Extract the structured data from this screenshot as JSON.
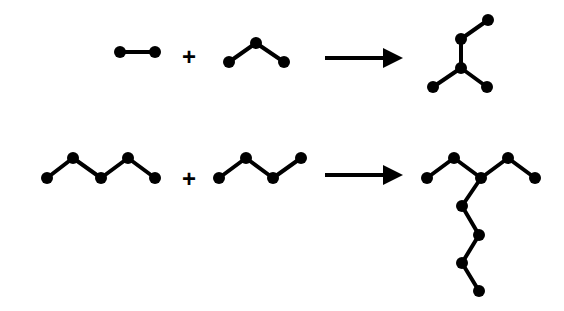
{
  "diagram": {
    "style": {
      "color": "#000000",
      "background": "#ffffff",
      "node_radius": 6,
      "bond_width": 4
    },
    "operators": {
      "plus": "+"
    },
    "reactions": [
      {
        "id": "reaction-1",
        "reactants": [
          {
            "name": "dimer",
            "nodes": [
              [
                120,
                52
              ],
              [
                155,
                52
              ]
            ],
            "bonds": [
              [
                0,
                1
              ]
            ]
          },
          {
            "name": "trimer",
            "nodes": [
              [
                229,
                62
              ],
              [
                256,
                43
              ],
              [
                284,
                62
              ]
            ],
            "bonds": [
              [
                0,
                1
              ],
              [
                1,
                2
              ]
            ]
          }
        ],
        "plus_position": [
          189,
          56
        ],
        "arrow": {
          "x1": 325,
          "x2": 395,
          "y": 58
        },
        "product": {
          "name": "branched-pentamer",
          "nodes": [
            [
              488,
              20
            ],
            [
              461,
              39
            ],
            [
              461,
              68
            ],
            [
              433,
              87
            ],
            [
              487,
              87
            ]
          ],
          "bonds": [
            [
              0,
              1
            ],
            [
              1,
              2
            ],
            [
              2,
              3
            ],
            [
              2,
              4
            ]
          ]
        }
      },
      {
        "id": "reaction-2",
        "reactants": [
          {
            "name": "pentamer",
            "nodes": [
              [
                47,
                178
              ],
              [
                73,
                158
              ],
              [
                101,
                178
              ],
              [
                128,
                158
              ],
              [
                155,
                178
              ]
            ],
            "bonds": [
              [
                0,
                1
              ],
              [
                1,
                2
              ],
              [
                2,
                3
              ],
              [
                3,
                4
              ]
            ]
          },
          {
            "name": "tetramer",
            "nodes": [
              [
                219,
                178
              ],
              [
                246,
                158
              ],
              [
                273,
                178
              ],
              [
                301,
                158
              ]
            ],
            "bonds": [
              [
                0,
                1
              ],
              [
                1,
                2
              ],
              [
                2,
                3
              ]
            ]
          }
        ],
        "plus_position": [
          189,
          178
        ],
        "arrow": {
          "x1": 325,
          "x2": 395,
          "y": 175
        },
        "product": {
          "name": "branched-nonamer",
          "nodes": [
            [
              427,
              178
            ],
            [
              454,
              158
            ],
            [
              481,
              178
            ],
            [
              508,
              158
            ],
            [
              535,
              178
            ],
            [
              462,
              206
            ],
            [
              479,
              235
            ],
            [
              462,
              263
            ],
            [
              479,
              291
            ]
          ],
          "bonds": [
            [
              0,
              1
            ],
            [
              1,
              2
            ],
            [
              2,
              3
            ],
            [
              3,
              4
            ],
            [
              2,
              5
            ],
            [
              5,
              6
            ],
            [
              6,
              7
            ],
            [
              7,
              8
            ]
          ]
        }
      }
    ]
  }
}
